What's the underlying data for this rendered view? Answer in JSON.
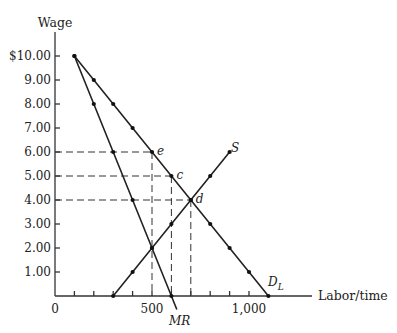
{
  "chart_data": {
    "type": "line",
    "title": "",
    "xlabel": "Labor/time",
    "ylabel": "Wage",
    "xlim": [
      0,
      1250
    ],
    "ylim": [
      0,
      11
    ],
    "grid": false,
    "x_ticks": [
      100,
      200,
      300,
      400,
      500,
      600,
      700,
      800,
      900,
      1000
    ],
    "x_tick_labels": [
      {
        "value": 0,
        "label": "0"
      },
      {
        "value": 500,
        "label": "500"
      },
      {
        "value": 1000,
        "label": "1,000"
      }
    ],
    "y_tick_labels": [
      {
        "value": 10,
        "label": "$10.00"
      },
      {
        "value": 9,
        "label": "9.00"
      },
      {
        "value": 8,
        "label": "8.00"
      },
      {
        "value": 7,
        "label": "7.00"
      },
      {
        "value": 6,
        "label": "6.00"
      },
      {
        "value": 5,
        "label": "5.00"
      },
      {
        "value": 4,
        "label": "4.00"
      },
      {
        "value": 3,
        "label": "3.00"
      },
      {
        "value": 2,
        "label": "2.00"
      },
      {
        "value": 1,
        "label": "1.00"
      }
    ],
    "series": [
      {
        "name": "D_L",
        "label": "D",
        "label_sub": "L",
        "points": [
          [
            100,
            10
          ],
          [
            200,
            9
          ],
          [
            300,
            8
          ],
          [
            400,
            7
          ],
          [
            500,
            6
          ],
          [
            600,
            5
          ],
          [
            700,
            4
          ],
          [
            800,
            3
          ],
          [
            900,
            2
          ],
          [
            1000,
            1
          ],
          [
            1100,
            0
          ]
        ]
      },
      {
        "name": "MR",
        "label": "MR",
        "points": [
          [
            100,
            10
          ],
          [
            200,
            8
          ],
          [
            300,
            6
          ],
          [
            400,
            4
          ],
          [
            500,
            2
          ],
          [
            600,
            0
          ]
        ]
      },
      {
        "name": "S",
        "label": "S",
        "points": [
          [
            300,
            0
          ],
          [
            400,
            1
          ],
          [
            500,
            2
          ],
          [
            600,
            3
          ],
          [
            700,
            4
          ],
          [
            800,
            5
          ],
          [
            900,
            6
          ]
        ]
      }
    ],
    "annotations": [
      {
        "label": "e",
        "x": 500,
        "y": 6
      },
      {
        "label": "c",
        "x": 600,
        "y": 5
      },
      {
        "label": "d",
        "x": 700,
        "y": 4
      }
    ],
    "guides": [
      {
        "type": "horizontal",
        "y": 6,
        "to_x": 500
      },
      {
        "type": "horizontal",
        "y": 5,
        "to_x": 600
      },
      {
        "type": "horizontal",
        "y": 4,
        "to_x": 700
      },
      {
        "type": "vertical",
        "x": 500,
        "from_y": 6
      },
      {
        "type": "vertical",
        "x": 600,
        "from_y": 5
      },
      {
        "type": "vertical",
        "x": 700,
        "from_y": 4
      }
    ],
    "legend": "none"
  }
}
